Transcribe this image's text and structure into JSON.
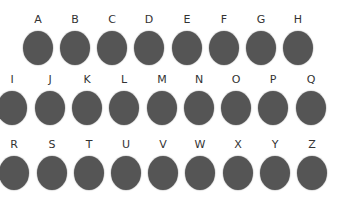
{
  "colors": {
    "dot": "#555555",
    "label": "#333333",
    "background": "#ffffff"
  },
  "rows": [
    {
      "items": [
        {
          "letter": "A",
          "x": 38,
          "y": 14
        },
        {
          "letter": "B",
          "x": 75,
          "y": 14
        },
        {
          "letter": "C",
          "x": 112,
          "y": 14
        },
        {
          "letter": "D",
          "x": 149,
          "y": 14
        },
        {
          "letter": "E",
          "x": 187,
          "y": 14
        },
        {
          "letter": "F",
          "x": 224,
          "y": 14
        },
        {
          "letter": "G",
          "x": 261,
          "y": 14
        },
        {
          "letter": "H",
          "x": 298,
          "y": 14
        }
      ]
    },
    {
      "items": [
        {
          "letter": "I",
          "x": 12,
          "y": 74
        },
        {
          "letter": "J",
          "x": 50,
          "y": 74
        },
        {
          "letter": "K",
          "x": 87,
          "y": 74
        },
        {
          "letter": "L",
          "x": 124,
          "y": 74
        },
        {
          "letter": "M",
          "x": 162,
          "y": 74
        },
        {
          "letter": "N",
          "x": 199,
          "y": 74
        },
        {
          "letter": "O",
          "x": 236,
          "y": 74
        },
        {
          "letter": "P",
          "x": 273,
          "y": 74
        },
        {
          "letter": "Q",
          "x": 311,
          "y": 74
        }
      ]
    },
    {
      "items": [
        {
          "letter": "R",
          "x": 14,
          "y": 139
        },
        {
          "letter": "S",
          "x": 52,
          "y": 139
        },
        {
          "letter": "T",
          "x": 89,
          "y": 139
        },
        {
          "letter": "U",
          "x": 126,
          "y": 139
        },
        {
          "letter": "V",
          "x": 163,
          "y": 139
        },
        {
          "letter": "W",
          "x": 200,
          "y": 139
        },
        {
          "letter": "X",
          "x": 238,
          "y": 139
        },
        {
          "letter": "Y",
          "x": 275,
          "y": 139
        },
        {
          "letter": "Z",
          "x": 312,
          "y": 139
        }
      ]
    }
  ]
}
